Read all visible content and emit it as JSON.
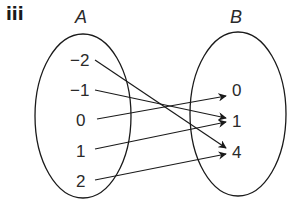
{
  "part_label": "iii",
  "domain_set": {
    "name": "A",
    "elements": [
      "-2",
      "-1",
      "0",
      "1",
      "2"
    ]
  },
  "codomain_set": {
    "name": "B",
    "elements": [
      "0",
      "1",
      "4"
    ]
  },
  "mappings": [
    {
      "from": "-2",
      "to": "4"
    },
    {
      "from": "-1",
      "to": "1"
    },
    {
      "from": "0",
      "to": "0"
    },
    {
      "from": "1",
      "to": "1"
    },
    {
      "from": "2",
      "to": "4"
    }
  ],
  "colors": {
    "stroke": "#1a1a1a",
    "background": "#ffffff"
  }
}
